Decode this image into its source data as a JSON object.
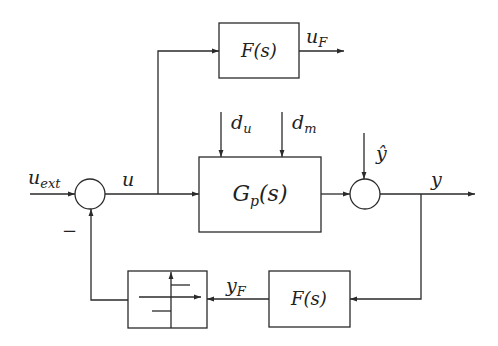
{
  "diagram": {
    "type": "block-diagram",
    "blocks": {
      "filter_top": {
        "label": "F(s)"
      },
      "plant": {
        "label_main": "G",
        "label_sub": "p",
        "label_tail": "(s)"
      },
      "filter_bottom": {
        "label": "F(s)"
      },
      "quantizer": {
        "label": ""
      }
    },
    "signals": {
      "u_ext": {
        "main": "u",
        "sub": "ext"
      },
      "u": {
        "main": "u"
      },
      "u_F": {
        "main": "u",
        "sub": "F"
      },
      "d_u": {
        "main": "d",
        "sub": "u"
      },
      "d_m": {
        "main": "d",
        "sub": "m"
      },
      "y_hat": {
        "main": "ŷ"
      },
      "y": {
        "main": "y"
      },
      "y_F": {
        "main": "y",
        "sub": "F"
      }
    },
    "summing_junctions": [
      {
        "id": "sum1",
        "sign_feedback": "−"
      },
      {
        "id": "sum2"
      }
    ],
    "colors": {
      "stroke": "#2a2a2a",
      "background": "#ffffff"
    }
  }
}
